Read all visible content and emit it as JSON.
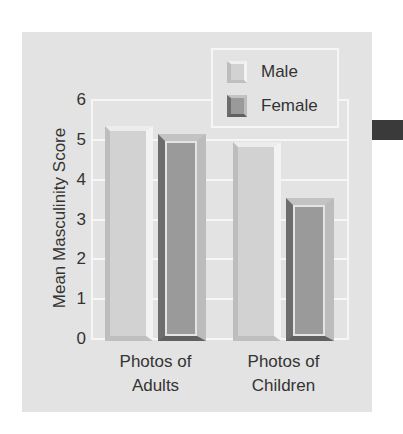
{
  "chart_data": {
    "type": "bar",
    "title": "",
    "xlabel": "",
    "ylabel": "Mean Masculinity Score",
    "categories": [
      "Photos of Adults",
      "Photos of Children"
    ],
    "category_lines": [
      [
        "Photos of",
        "Adults"
      ],
      [
        "Photos of",
        "Children"
      ]
    ],
    "series": [
      {
        "name": "Male",
        "values": [
          5.2,
          4.8
        ],
        "color": "#d2d2d2"
      },
      {
        "name": "Female",
        "values": [
          5.0,
          3.4
        ],
        "color": "#9a9a9a"
      }
    ],
    "ylim": [
      0,
      6
    ],
    "yticks": [
      "0",
      "1",
      "2",
      "3",
      "4",
      "5",
      "6"
    ],
    "grid": true,
    "legend_position": "top-right"
  }
}
